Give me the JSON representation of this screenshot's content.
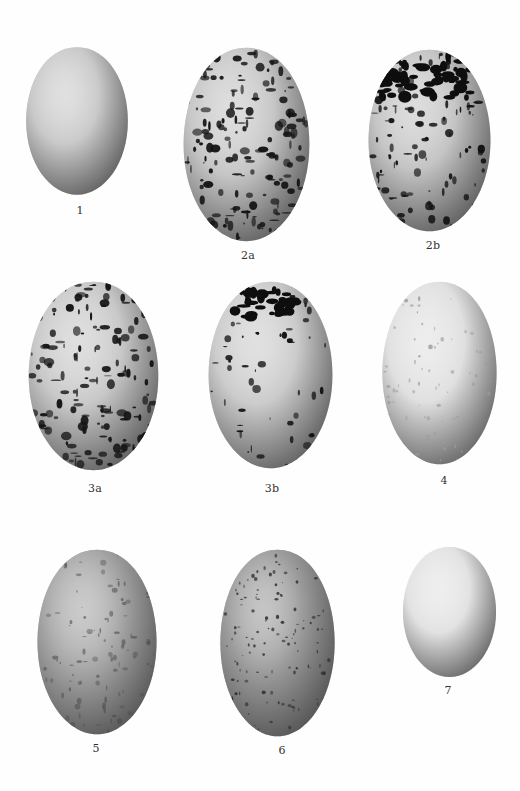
{
  "plate": {
    "background": "#fefefe",
    "eggs": [
      {
        "id": "1",
        "label": "1",
        "pattern": "plain",
        "base": "#c9c9c9",
        "x": 24,
        "y": 45,
        "w": 106,
        "h": 152,
        "lx": 80,
        "ly": 204
      },
      {
        "id": "2a",
        "label": "2a",
        "pattern": "heavy",
        "base": "#c6c6c6",
        "x": 181,
        "y": 45,
        "w": 131,
        "h": 199,
        "lx": 248,
        "ly": 249
      },
      {
        "id": "2b",
        "label": "2b",
        "pattern": "capped",
        "base": "#c4c4c4",
        "x": 366,
        "y": 47,
        "w": 127,
        "h": 187,
        "lx": 433,
        "ly": 239
      },
      {
        "id": "3a",
        "label": "3a",
        "pattern": "heavy",
        "base": "#c8c8c8",
        "x": 26,
        "y": 279,
        "w": 135,
        "h": 194,
        "lx": 95,
        "ly": 482
      },
      {
        "id": "3b",
        "label": "3b",
        "pattern": "capped-sparse",
        "base": "#cbcbcb",
        "x": 206,
        "y": 279,
        "w": 129,
        "h": 192,
        "lx": 272,
        "ly": 482
      },
      {
        "id": "4",
        "label": "4",
        "pattern": "faint",
        "base": "#e0e0e0",
        "x": 380,
        "y": 279,
        "w": 119,
        "h": 188,
        "lx": 444,
        "ly": 474
      },
      {
        "id": "5",
        "label": "5",
        "pattern": "mottled",
        "base": "#a5a5a5",
        "x": 35,
        "y": 547,
        "w": 124,
        "h": 190,
        "lx": 96,
        "ly": 742
      },
      {
        "id": "6",
        "label": "6",
        "pattern": "speckled",
        "base": "#9c9c9c",
        "x": 218,
        "y": 547,
        "w": 119,
        "h": 192,
        "lx": 282,
        "ly": 744
      },
      {
        "id": "7",
        "label": "7",
        "pattern": "plain",
        "base": "#e2e2e2",
        "x": 401,
        "y": 545,
        "w": 97,
        "h": 134,
        "lx": 448,
        "ly": 684
      }
    ]
  }
}
